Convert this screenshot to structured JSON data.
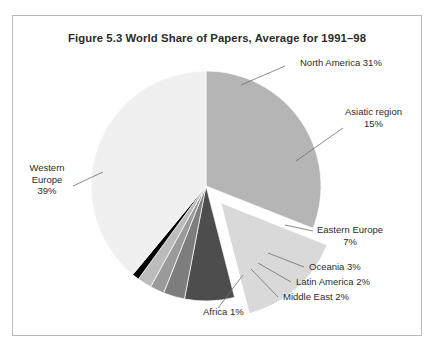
{
  "figure": {
    "title": "Figure 5.3 World Share of Papers, Average for 1991–98",
    "frame_color": "#b9b9b9",
    "background": "#ffffff"
  },
  "chart_data": {
    "type": "pie",
    "title": "Figure 5.3 World Share of Papers, Average for 1991–98",
    "xlabel": "",
    "ylabel": "",
    "unit": "%",
    "legend": "none",
    "grid": false,
    "start_angle_deg": 0,
    "direction": "clockwise",
    "categories": [
      "North America",
      "Asiatic region",
      "Eastern Europe",
      "Oceania",
      "Latin America",
      "Middle East",
      "Africa",
      "Western Europe"
    ],
    "values": [
      31,
      15,
      7,
      3,
      2,
      2,
      1,
      39
    ],
    "colors": [
      "#b5b5b5",
      "#d9d9d9",
      "#4d4d4d",
      "#7d7d7d",
      "#9a9a9a",
      "#bcbcbc",
      "#000000",
      "#f0f0f0"
    ],
    "exploded": [
      "Asiatic region"
    ],
    "slices": [
      {
        "name": "North America",
        "value": 31,
        "label": "North America 31%",
        "color": "#b5b5b5",
        "exploded": false
      },
      {
        "name": "Asiatic region",
        "value": 15,
        "label": "Asiatic region 15%",
        "color": "#d9d9d9",
        "exploded": true
      },
      {
        "name": "Eastern Europe",
        "value": 7,
        "label": "Eastern Europe 7%",
        "color": "#4d4d4d",
        "exploded": false
      },
      {
        "name": "Oceania",
        "value": 3,
        "label": "Oceania 3%",
        "color": "#7d7d7d",
        "exploded": false
      },
      {
        "name": "Latin America",
        "value": 2,
        "label": "Latin America 2%",
        "color": "#9a9a9a",
        "exploded": false
      },
      {
        "name": "Middle East",
        "value": 2,
        "label": "Middle East 2%",
        "color": "#bcbcbc",
        "exploded": false
      },
      {
        "name": "Africa",
        "value": 1,
        "label": "Africa 1%",
        "color": "#000000",
        "exploded": false
      },
      {
        "name": "Western Europe",
        "value": 39,
        "label": "Western Europe 39%",
        "color": "#f0f0f0",
        "exploded": false
      }
    ]
  },
  "labels": {
    "north_america_name": "North America 31%",
    "asiatic_name": "Asiatic region",
    "asiatic_value": "15%",
    "western_europe_l1": "Western",
    "western_europe_l2": "Europe",
    "western_europe_l3": "39%",
    "eastern_europe_name": "Eastern Europe",
    "eastern_europe_value": "7%",
    "oceania": "Oceania 3%",
    "latin_america": "Latin America 2%",
    "middle_east": "Middle East 2%",
    "africa": "Africa 1%"
  }
}
